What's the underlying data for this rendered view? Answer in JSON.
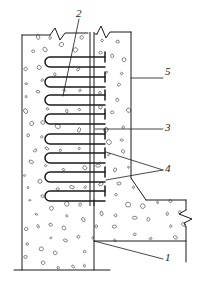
{
  "drawing": {
    "title": "Concrete Wall Construction Joint Detail",
    "type": "engineering-section-detail",
    "ink_color": "#1b1b1b",
    "paper_color": "#ffffff",
    "aggregate_color": "#5a5a5a"
  },
  "callouts": [
    {
      "id": "1",
      "label": "1",
      "x": 167,
      "y": 259,
      "leader_from": [
        163,
        259
      ],
      "leader_to": [
        94,
        241
      ]
    },
    {
      "id": "2",
      "label": "2",
      "x": 77,
      "y": 10,
      "leader_from": [
        79,
        19
      ],
      "leader_to": [
        63,
        96
      ]
    },
    {
      "id": "3",
      "label": "3",
      "x": 167,
      "y": 125,
      "leader_from": [
        163,
        129
      ],
      "leader_to": [
        95,
        129
      ]
    },
    {
      "id": "4",
      "label": "4",
      "x": 167,
      "y": 165,
      "leader_from": [
        163,
        170
      ],
      "leader_to": [
        106,
        152
      ]
    },
    {
      "id": "5",
      "label": "5",
      "x": 167,
      "y": 72,
      "leader_from": [
        163,
        78
      ],
      "leader_to": [
        131,
        78
      ]
    }
  ],
  "geometry": {
    "wall_left_x": 22,
    "wall_right_x": 131,
    "wall_top_y": 35,
    "wall_base_y": 270,
    "joint_x_left": 90,
    "joint_x_right": 95,
    "ledge_y": 200,
    "footing_top_y": 241,
    "base_line_y": 270,
    "base_line_x1": 14,
    "base_line_x2": 110
  },
  "rebar": {
    "hairpin_count": 8,
    "hairpin_rows_y": [
      62,
      82,
      100,
      119,
      139,
      158,
      177,
      196
    ],
    "hairpin_left_x": 44,
    "hairpin_tip_x": 105,
    "tbar_x": 105,
    "tbar_half_height": 5,
    "loop_height": 9
  },
  "break_symbols": [
    {
      "name": "break-top-left",
      "x": 57,
      "y": 35
    },
    {
      "name": "break-top-right",
      "x": 100,
      "y": 35
    },
    {
      "name": "break-right-edge",
      "x": 186,
      "y": 215
    }
  ],
  "annotations": {
    "chamfer_start": [
      131,
      178
    ],
    "chamfer_end": [
      146,
      200
    ],
    "right_edge_x": 186,
    "ledge_end_x": 186
  }
}
